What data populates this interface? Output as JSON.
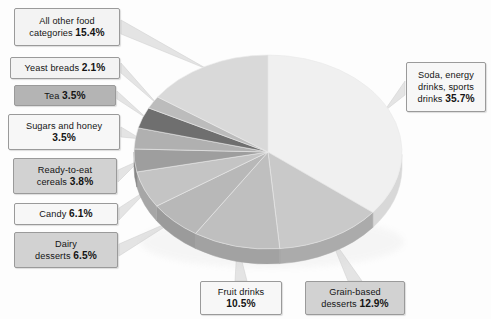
{
  "chart_data": {
    "type": "pie",
    "title": "",
    "subtitle": "",
    "xlabel": "",
    "ylabel": "",
    "legend_position": "callout-labels",
    "grid": false,
    "units": "percent",
    "total": 100.0,
    "categories": [
      "Soda, energy drinks, sports drinks",
      "Grain-based desserts",
      "Fruit drinks",
      "Dairy desserts",
      "Candy",
      "Ready-to-eat cereals",
      "Sugars and honey",
      "Tea",
      "Yeast breads",
      "All other food categories"
    ],
    "values": [
      35.7,
      12.9,
      10.5,
      6.5,
      6.1,
      3.8,
      3.5,
      3.5,
      2.1,
      15.4
    ],
    "slices": [
      {
        "label": "Soda, energy drinks, sports drinks",
        "value": 35.7,
        "value_text": "35.7%",
        "color": "#f0f0f0",
        "side_color": "#d8d8d8"
      },
      {
        "label": "Grain-based desserts",
        "value": 12.9,
        "value_text": "12.9%",
        "color": "#c9c9c9",
        "side_color": "#ababab"
      },
      {
        "label": "Fruit drinks",
        "value": 10.5,
        "value_text": "10.5%",
        "color": "#bfbfbf",
        "side_color": "#a2a2a2"
      },
      {
        "label": "Dairy desserts",
        "value": 6.5,
        "value_text": "6.5%",
        "color": "#b8b8b8",
        "side_color": "#9b9b9b"
      },
      {
        "label": "Candy",
        "value": 6.1,
        "value_text": "6.1%",
        "color": "#c4c4c4",
        "side_color": "#a6a6a6"
      },
      {
        "label": "Ready-to-eat cereals",
        "value": 3.8,
        "value_text": "3.8%",
        "color": "#9e9e9e",
        "side_color": "#868686"
      },
      {
        "label": "Sugars and honey",
        "value": 3.5,
        "value_text": "3.5%",
        "color": "#b0b0b0",
        "side_color": "#949494"
      },
      {
        "label": "Tea",
        "value": 3.5,
        "value_text": "3.5%",
        "color": "#6f6f6f",
        "side_color": "#5e5e5e"
      },
      {
        "label": "Yeast breads",
        "value": 2.1,
        "value_text": "2.1%",
        "color": "#bcbcbc",
        "side_color": "#9f9f9f"
      },
      {
        "label": "All other food categories",
        "value": 15.4,
        "value_text": "15.4%",
        "color": "#d9d9d9",
        "side_color": "#bcbcbc"
      }
    ]
  },
  "callouts": {
    "all_other": {
      "name": "All other food",
      "name2": "categories",
      "pct": "15.4%"
    },
    "yeast": {
      "name": "Yeast breads",
      "pct": "2.1%"
    },
    "tea": {
      "name": "Tea",
      "pct": "3.5%"
    },
    "sugars": {
      "name": "Sugars and honey",
      "pct": "3.5%"
    },
    "cereals": {
      "name": "Ready-to-eat",
      "name2": "cereals",
      "pct": "3.8%"
    },
    "candy": {
      "name": "Candy",
      "pct": "6.1%"
    },
    "dairy": {
      "name": "Dairy",
      "name2": "desserts",
      "pct": "6.5%"
    },
    "soda": {
      "name": "Soda, energy",
      "name2": "drinks, sports",
      "name3": "drinks",
      "pct": "35.7%"
    },
    "grain": {
      "name": "Grain-based",
      "name2": "desserts",
      "pct": "12.9%"
    },
    "fruit": {
      "name": "Fruit drinks",
      "pct": "10.5%"
    }
  },
  "colors": {
    "background": "#fdfdfd",
    "box_border": "#9a9a9a",
    "leader_line": "#e4e4e4",
    "text": "#141414"
  }
}
